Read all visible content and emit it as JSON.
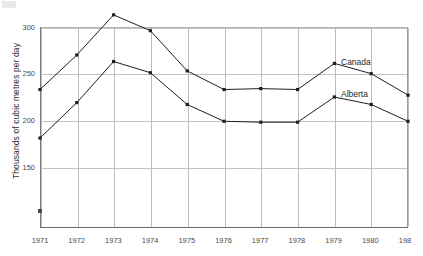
{
  "chart_data": {
    "type": "line",
    "title": "",
    "subtitle": "",
    "xlabel": "",
    "ylabel": "Thousands of cubic metres per day",
    "categories": [
      "1971",
      "1972",
      "1973",
      "1974",
      "1975",
      "1976",
      "1977",
      "1978",
      "1979",
      "1980",
      "198"
    ],
    "x": [
      1971,
      1972,
      1973,
      1974,
      1975,
      1976,
      1977,
      1978,
      1979,
      1980,
      1981
    ],
    "xlim": [
      1971,
      1981
    ],
    "ylim": [
      120,
      325
    ],
    "yticks": [
      150,
      200,
      250,
      300
    ],
    "ytick_labels": [
      "150",
      "200",
      "250",
      "300"
    ],
    "grid": "both",
    "legend_position": "inline-right",
    "markers": "square",
    "series": [
      {
        "name": "Canada",
        "color": "#1f1f1f",
        "values": [
          233,
          270,
          313,
          296,
          253,
          233,
          234,
          233,
          261,
          250,
          227
        ],
        "label_text": "Canada"
      },
      {
        "name": "Alberta",
        "color": "#1f1f1f",
        "values": [
          181,
          219,
          263,
          251,
          217,
          199,
          198,
          198,
          225,
          217,
          199
        ],
        "label_text": "Alberta"
      }
    ],
    "annotations": [
      {
        "text": "Canada",
        "near_year": 1979,
        "near_value": 262
      },
      {
        "text": "Alberta",
        "near_year": 1979,
        "near_value": 226
      }
    ]
  },
  "axes": {
    "y_title": "Thousands of cubic metres per day",
    "y_tick_labels": [
      "300",
      "250",
      "200",
      "150"
    ],
    "x_tick_labels": [
      "1971",
      "1972",
      "1973",
      "1974",
      "1975",
      "1976",
      "1977",
      "1978",
      "1979",
      "1980",
      "198"
    ]
  },
  "legend": {
    "canada": "Canada",
    "alberta": "Alberta"
  }
}
